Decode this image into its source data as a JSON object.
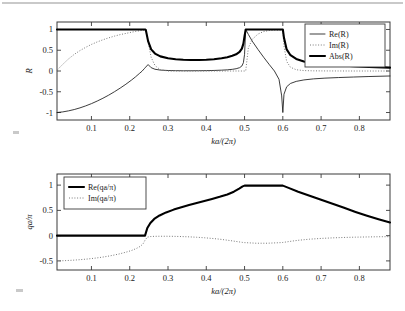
{
  "figure": {
    "background": "#ffffff",
    "panels": [
      "top",
      "bottom"
    ]
  },
  "chart_data": [
    {
      "id": "top",
      "type": "line",
      "title": "",
      "xlabel": "ka/(2π)",
      "ylabel": "R",
      "xlim": [
        0.01,
        0.88
      ],
      "ylim": [
        -1.18,
        1.18
      ],
      "xticks": [
        0.1,
        0.2,
        0.3,
        0.4,
        0.5,
        0.6,
        0.7,
        0.8
      ],
      "xticklabels": [
        "0.1",
        "0.2",
        "0.3",
        "0.4",
        "0.5",
        "0.6",
        "0.7",
        "0.8"
      ],
      "yticks": [
        -1,
        -0.5,
        0,
        0.5,
        1
      ],
      "yticklabels": [
        "-1",
        "-0.5",
        "0",
        "0.5",
        "1"
      ],
      "grid": false,
      "legend_position": "upper right",
      "x": [
        0.01,
        0.025,
        0.04,
        0.055,
        0.07,
        0.085,
        0.1,
        0.115,
        0.13,
        0.145,
        0.16,
        0.175,
        0.19,
        0.205,
        0.215,
        0.225,
        0.232,
        0.238,
        0.24,
        0.242,
        0.248,
        0.256,
        0.266,
        0.28,
        0.3,
        0.32,
        0.34,
        0.36,
        0.38,
        0.4,
        0.42,
        0.44,
        0.455,
        0.468,
        0.478,
        0.487,
        0.493,
        0.497,
        0.5,
        0.503,
        0.51,
        0.52,
        0.535,
        0.55,
        0.565,
        0.578,
        0.59,
        0.597,
        0.6,
        0.603,
        0.61,
        0.62,
        0.635,
        0.655,
        0.68,
        0.71,
        0.745,
        0.785,
        0.825,
        0.88
      ],
      "series": [
        {
          "name": "Re(R)",
          "style": "thin-solid",
          "values": [
            -1.0,
            -0.985,
            -0.96,
            -0.928,
            -0.888,
            -0.84,
            -0.786,
            -0.724,
            -0.656,
            -0.582,
            -0.5,
            -0.412,
            -0.318,
            -0.216,
            -0.142,
            -0.062,
            -0.006,
            0.055,
            0.075,
            0.096,
            0.155,
            0.08,
            0.042,
            0.022,
            0.012,
            0.008,
            0.006,
            0.006,
            0.007,
            0.009,
            0.013,
            0.02,
            0.028,
            0.04,
            0.055,
            0.08,
            0.12,
            0.2,
            0.4,
            1.0,
            0.88,
            0.72,
            0.52,
            0.33,
            0.15,
            0.0,
            -0.2,
            -0.6,
            -1.0,
            -0.56,
            -0.38,
            -0.3,
            -0.25,
            -0.215,
            -0.19,
            -0.172,
            -0.158,
            -0.145,
            -0.133,
            -0.12
          ]
        },
        {
          "name": "Im(R)",
          "style": "dotted",
          "values": [
            0.02,
            0.16,
            0.29,
            0.4,
            0.492,
            0.57,
            0.64,
            0.7,
            0.752,
            0.798,
            0.84,
            0.876,
            0.905,
            0.935,
            0.952,
            0.968,
            0.978,
            0.985,
            0.988,
            0.985,
            0.7,
            0.33,
            0.13,
            0.03,
            0.0,
            0.0,
            0.0,
            0.0,
            0.0,
            0.0,
            0.0,
            0.0,
            0.0,
            0.0,
            0.0,
            0.0,
            0.0,
            0.0,
            0.0,
            0.0,
            0.56,
            0.76,
            0.89,
            0.95,
            0.975,
            0.985,
            0.985,
            0.98,
            0.975,
            0.6,
            0.23,
            0.09,
            0.03,
            0.01,
            0.004,
            0.002,
            0.001,
            0.0,
            0.0,
            0.0
          ]
        },
        {
          "name": "Abs(R)",
          "style": "thick-solid",
          "values": [
            1.0,
            1.0,
            1.0,
            1.0,
            1.0,
            1.0,
            1.0,
            1.0,
            1.0,
            1.0,
            1.0,
            1.0,
            1.0,
            1.0,
            1.0,
            1.0,
            1.0,
            1.0,
            1.0,
            0.99,
            0.72,
            0.52,
            0.42,
            0.352,
            0.306,
            0.284,
            0.272,
            0.266,
            0.266,
            0.27,
            0.282,
            0.305,
            0.33,
            0.366,
            0.402,
            0.46,
            0.54,
            0.66,
            0.84,
            1.0,
            1.0,
            1.0,
            1.0,
            1.0,
            1.0,
            1.0,
            1.0,
            1.0,
            1.0,
            0.8,
            0.52,
            0.38,
            0.29,
            0.23,
            0.19,
            0.16,
            0.138,
            0.118,
            0.1,
            0.082
          ]
        }
      ]
    },
    {
      "id": "bottom",
      "type": "line",
      "title": "",
      "xlabel": "ka/(2π)",
      "ylabel": "qa/π",
      "xlim": [
        0.01,
        0.88
      ],
      "ylim": [
        -0.68,
        1.22
      ],
      "xticks": [
        0.1,
        0.2,
        0.3,
        0.4,
        0.5,
        0.6,
        0.7,
        0.8
      ],
      "xticklabels": [
        "0.1",
        "0.2",
        "0.3",
        "0.4",
        "0.5",
        "0.6",
        "0.7",
        "0.8"
      ],
      "yticks": [
        -0.5,
        0,
        0.5,
        1
      ],
      "yticklabels": [
        "-0.5",
        "0",
        "0.5",
        "1"
      ],
      "grid": false,
      "legend_position": "upper left",
      "x": [
        0.01,
        0.03,
        0.05,
        0.07,
        0.09,
        0.11,
        0.13,
        0.15,
        0.17,
        0.19,
        0.205,
        0.218,
        0.228,
        0.235,
        0.24,
        0.246,
        0.254,
        0.264,
        0.278,
        0.295,
        0.315,
        0.335,
        0.355,
        0.375,
        0.395,
        0.415,
        0.435,
        0.455,
        0.472,
        0.486,
        0.495,
        0.5,
        0.53,
        0.56,
        0.59,
        0.6,
        0.615,
        0.64,
        0.67,
        0.7,
        0.73,
        0.76,
        0.79,
        0.82,
        0.85,
        0.88
      ],
      "series": [
        {
          "name": "Re(qa/π)",
          "style": "thick-solid",
          "values": [
            0.0,
            0.0,
            0.0,
            0.0,
            0.0,
            0.0,
            0.0,
            0.0,
            0.0,
            0.0,
            0.0,
            0.0,
            0.0,
            0.0,
            0.0,
            0.15,
            0.25,
            0.33,
            0.4,
            0.46,
            0.515,
            0.562,
            0.605,
            0.645,
            0.685,
            0.725,
            0.768,
            0.815,
            0.87,
            0.93,
            0.975,
            0.99,
            0.99,
            0.99,
            0.99,
            0.99,
            0.945,
            0.87,
            0.79,
            0.71,
            0.63,
            0.55,
            0.47,
            0.395,
            0.325,
            0.26
          ]
        },
        {
          "name": "Im(qa/π)",
          "style": "dotted",
          "values": [
            -0.5,
            -0.495,
            -0.487,
            -0.476,
            -0.462,
            -0.445,
            -0.424,
            -0.398,
            -0.367,
            -0.328,
            -0.293,
            -0.252,
            -0.21,
            -0.16,
            -0.09,
            -0.03,
            -0.018,
            -0.014,
            -0.012,
            -0.012,
            -0.014,
            -0.018,
            -0.024,
            -0.032,
            -0.042,
            -0.055,
            -0.07,
            -0.09,
            -0.108,
            -0.124,
            -0.134,
            -0.138,
            -0.15,
            -0.15,
            -0.14,
            -0.135,
            -0.118,
            -0.092,
            -0.07,
            -0.055,
            -0.044,
            -0.036,
            -0.03,
            -0.026,
            -0.022,
            -0.02
          ]
        }
      ]
    }
  ],
  "top_panel": {
    "ylabel": "R",
    "xlabel": "ka/(2π)",
    "legend": [
      {
        "label": "Re(R)",
        "style": "thin-solid"
      },
      {
        "label": "Im(R)",
        "style": "dotted"
      },
      {
        "label": "Abs(R)",
        "style": "thick-solid"
      }
    ],
    "xticklabels": [
      "0.1",
      "0.2",
      "0.3",
      "0.4",
      "0.5",
      "0.6",
      "0.7",
      "0.8"
    ],
    "yticklabels": [
      "1",
      "0.5",
      "0",
      "-0.5",
      "-1"
    ]
  },
  "bottom_panel": {
    "ylabel": "qa/π",
    "xlabel": "ka/(2π)",
    "legend": [
      {
        "label": "Re(qa/π)",
        "style": "thick-solid"
      },
      {
        "label": "Im(qa/π)",
        "style": "dotted"
      }
    ],
    "xticklabels": [
      "0.1",
      "0.2",
      "0.3",
      "0.4",
      "0.5",
      "0.6",
      "0.7",
      "0.8"
    ],
    "yticklabels": [
      "1",
      "0.5",
      "0",
      "-0.5"
    ]
  }
}
